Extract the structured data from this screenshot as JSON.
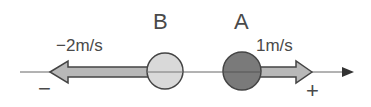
{
  "diagram": {
    "objects": [
      {
        "id": "B",
        "label": "B",
        "color": "#d9d9d9"
      },
      {
        "id": "A",
        "label": "A",
        "color": "#7a7a7a"
      }
    ],
    "velocities": {
      "B": "−2m/s",
      "A": "1m/s"
    },
    "axis": {
      "negative_sign": "−",
      "positive_sign": "+"
    },
    "colors": {
      "arrow_fill": "#b8b8b8",
      "stroke": "#444444",
      "axis": "#555555"
    }
  }
}
